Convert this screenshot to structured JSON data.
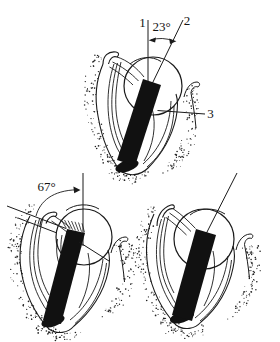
{
  "colors": {
    "ink": "#1a1a1a",
    "background": "#ffffff"
  },
  "diagrams": {
    "top": {
      "label_reference_line": "1",
      "label_instrument_line": "2",
      "angle": "23°",
      "label_marker": "3"
    },
    "bottom_left": {
      "angle": "67°"
    }
  }
}
